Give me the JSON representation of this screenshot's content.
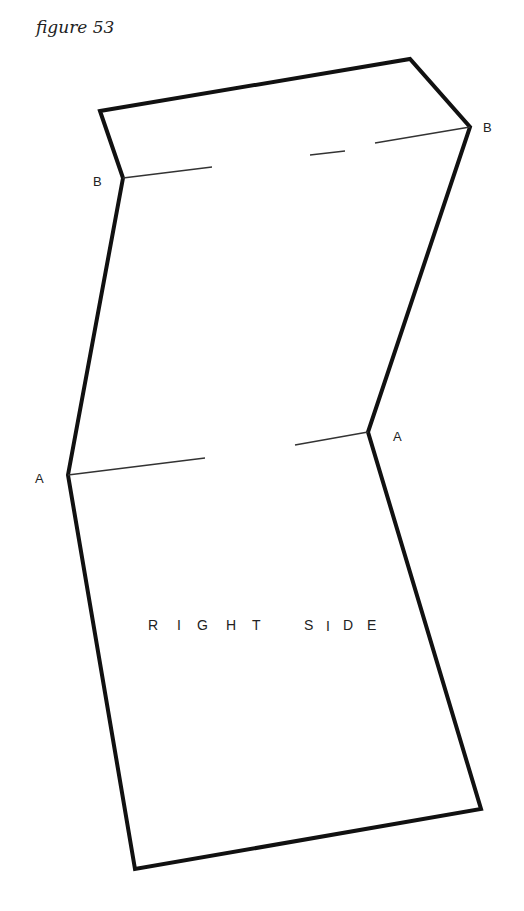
{
  "figure": {
    "title": "figure 53",
    "side_label": "R I G H T   S I D E",
    "side_label_letters": [
      "R",
      "I",
      "G",
      "H",
      "T",
      "S",
      "I",
      "D",
      "E"
    ],
    "fold_labels": {
      "b_left": "B",
      "b_right": "B",
      "a_left": "A",
      "a_right": "A"
    },
    "colors": {
      "outline": "#111111",
      "fold_line": "#333333",
      "text": "#222222",
      "background": "#ffffff"
    },
    "outline_points": [
      [
        100,
        111
      ],
      [
        410,
        59
      ],
      [
        470,
        127
      ],
      [
        368,
        432
      ],
      [
        481,
        809
      ],
      [
        135,
        869
      ],
      [
        68,
        475
      ],
      [
        123,
        178
      ]
    ],
    "fold_lines": {
      "b": [
        [
          [
            123,
            178
          ],
          [
            212,
            167
          ]
        ],
        [
          [
            310,
            155
          ],
          [
            345,
            151
          ]
        ],
        [
          [
            375,
            143
          ],
          [
            470,
            127
          ]
        ]
      ],
      "a": [
        [
          [
            68,
            475
          ],
          [
            205,
            458
          ]
        ],
        [
          [
            295,
            445
          ],
          [
            368,
            432
          ]
        ]
      ]
    }
  }
}
